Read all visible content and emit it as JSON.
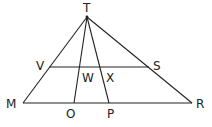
{
  "diagram": {
    "type": "geometry",
    "points": {
      "T": {
        "x": 87,
        "y": 17,
        "label": "T",
        "label_x": 83,
        "label_y": 12
      },
      "V": {
        "x": 49,
        "y": 67,
        "label": "V",
        "label_x": 36,
        "label_y": 70
      },
      "S": {
        "x": 149,
        "y": 67,
        "label": "S",
        "label_x": 153,
        "label_y": 70
      },
      "M": {
        "x": 23,
        "y": 103,
        "label": "M",
        "label_x": 6,
        "label_y": 108
      },
      "R": {
        "x": 192,
        "y": 103,
        "label": "R",
        "label_x": 196,
        "label_y": 108
      },
      "O": {
        "x": 74,
        "y": 103,
        "label": "O",
        "label_x": 66,
        "label_y": 118
      },
      "P": {
        "x": 109,
        "y": 103,
        "label": "P",
        "label_x": 107,
        "label_y": 118
      },
      "W": {
        "x": 79,
        "y": 67,
        "label": "W",
        "label_x": 82,
        "label_y": 82
      },
      "X": {
        "x": 100,
        "y": 67,
        "label": "X",
        "label_x": 106,
        "label_y": 82
      }
    },
    "segments": [
      {
        "from": "T",
        "to": "M"
      },
      {
        "from": "T",
        "to": "R"
      },
      {
        "from": "M",
        "to": "R"
      },
      {
        "from": "V",
        "to": "S"
      },
      {
        "from": "T",
        "to": "O"
      },
      {
        "from": "T",
        "to": "P"
      }
    ],
    "labels": [
      "T",
      "V",
      "W",
      "X",
      "S",
      "M",
      "O",
      "P",
      "R"
    ],
    "colors": {
      "line": "#222222",
      "background": "#ffffff"
    }
  }
}
